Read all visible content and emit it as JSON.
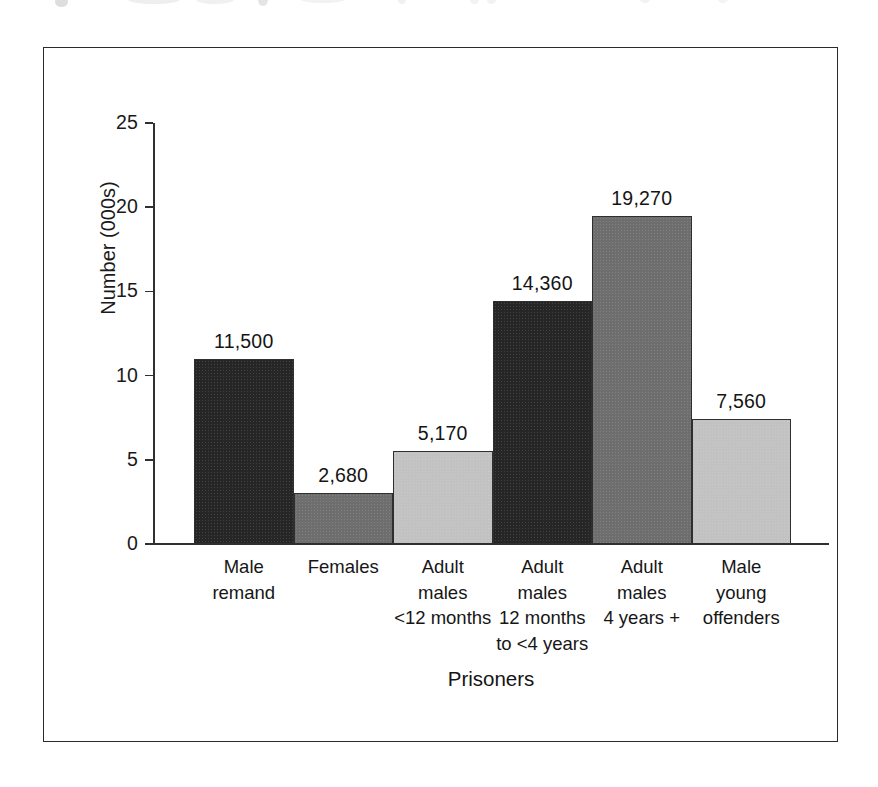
{
  "figure": {
    "frame_border_color": "#2b2b2b",
    "background": "#ffffff"
  },
  "chart_data": {
    "type": "bar",
    "title": "",
    "xlabel": "Prisoners",
    "ylabel": "Number (000s)",
    "ylim": [
      0,
      25
    ],
    "yticks": [
      "0",
      "5",
      "10",
      "15",
      "20",
      "25"
    ],
    "ytick_values": [
      0,
      5,
      10,
      15,
      20,
      25
    ],
    "grid": false,
    "legend": "none",
    "categories": [
      "Male remand",
      "Females",
      "Adult males <12 months",
      "Adult males 12 months to <4 years",
      "Adult males 4 years +",
      "Male young offenders"
    ],
    "category_lines": [
      [
        "Male",
        "remand"
      ],
      [
        "Females"
      ],
      [
        "Adult",
        "males",
        "<12 months"
      ],
      [
        "Adult",
        "males",
        "12 months",
        "to <4 years"
      ],
      [
        "Adult",
        "males",
        "4 years +"
      ],
      [
        "Male",
        "young",
        "offenders"
      ]
    ],
    "values": [
      11500,
      2680,
      5170,
      14360,
      19270,
      7560
    ],
    "value_labels": [
      "11,500",
      "2,680",
      "5,170",
      "14,360",
      "19,270",
      "7,560"
    ],
    "plotted_thousands": [
      11.0,
      3.05,
      5.55,
      14.45,
      19.5,
      7.45
    ],
    "bar_colors": [
      "#262626",
      "#6e6e6e",
      "#c2c2c2",
      "#262626",
      "#6e6e6e",
      "#c2c2c2"
    ],
    "bar_edge_color": "#2f2f2f"
  }
}
